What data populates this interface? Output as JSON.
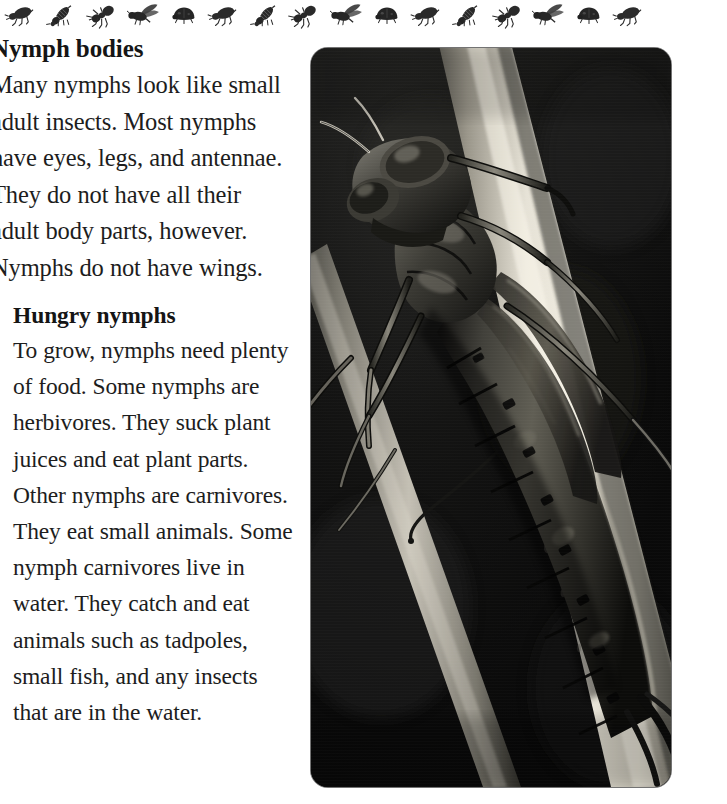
{
  "page": {
    "background_color": "#ffffff",
    "text_color": "#1d1d1d"
  },
  "border": {
    "name": "insect-border-strip",
    "description": "repeating row of small black-and-white insect silhouettes across the top of the page",
    "insects": [
      "beetle-icon",
      "wasp-icon",
      "ant-icon",
      "flying-wasp-icon",
      "ladybug-icon",
      "beetle-icon",
      "wasp-icon",
      "ant-icon",
      "flying-wasp-icon",
      "ladybug-icon",
      "beetle-icon",
      "wasp-icon",
      "ant-icon",
      "flying-wasp-icon",
      "ladybug-icon",
      "beetle-icon"
    ]
  },
  "sections": [
    {
      "id": "nymph-bodies",
      "heading": "Nymph bodies",
      "body": "Many nymphs look like small adult insects. Most nymphs have eyes, legs, and antennae. They do not have all their adult body parts, however. Nymphs do not have wings."
    },
    {
      "id": "hungry-nymphs",
      "heading": "Hungry nymphs",
      "body": "To grow, nymphs need plenty of food. Some nymphs are herbivores. They suck plant juices and eat plant parts. Other nymphs are carnivores. They eat small animals. Some nymph carnivores live in water. They catch and eat animals such as tadpoles, small fish, and any insects that are in the water."
    }
  ],
  "photo": {
    "name": "dragonfly-nymph-photograph",
    "description": "Close-up black-and-white photograph of a dragonfly nymph clinging to a pale plant stem that runs diagonally from the upper left to the lower right against a very dark background.",
    "background_color": "#0d0d0d",
    "stem_color": "#d8d4c8",
    "nymph_color": "#3a3a38",
    "corner_radius_px": 17
  }
}
